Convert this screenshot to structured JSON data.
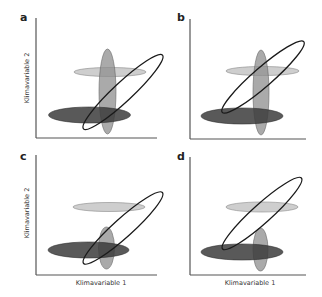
{
  "figure": {
    "colors": {
      "light": "#c6c6c6",
      "mid": "#8e8e8e",
      "dark": "#3c3c3c",
      "outline": "#1a1a1a",
      "axis": "#555555"
    },
    "panels": [
      {
        "label": "a",
        "ylabel": "Klimavariable 2",
        "xlabel": "",
        "light": {
          "cx": 110,
          "cy": 72,
          "rx": 36,
          "ry": 4.5
        },
        "vertical": {
          "cx": 107.5,
          "cy": 91.5,
          "rx": 8.5,
          "ry": 42.5
        },
        "dark": {
          "cx": 89.5,
          "cy": 115,
          "rx": 41,
          "ry": 8
        },
        "outline": {
          "cx": 123,
          "cy": 92,
          "rx": 54,
          "ry": 9.5,
          "angle": -43
        }
      },
      {
        "label": "b",
        "ylabel": "",
        "xlabel": "",
        "light": {
          "cx": 262.5,
          "cy": 71,
          "rx": 36.5,
          "ry": 4.5
        },
        "vertical": {
          "cx": 261,
          "cy": 92.5,
          "rx": 8,
          "ry": 42.5
        },
        "dark": {
          "cx": 242,
          "cy": 116,
          "rx": 41,
          "ry": 8
        },
        "outline": {
          "cx": 263,
          "cy": 77,
          "rx": 54,
          "ry": 9.5,
          "angle": -41
        }
      },
      {
        "label": "c",
        "ylabel": "Klimavariable 2",
        "xlabel": "Klimavariable 1",
        "light": {
          "cx": 109,
          "cy": 207,
          "rx": 36,
          "ry": 4.5
        },
        "vertical": {
          "cx": 106.5,
          "cy": 248,
          "rx": 8,
          "ry": 21
        },
        "dark": {
          "cx": 88.5,
          "cy": 250,
          "rx": 40.5,
          "ry": 8
        },
        "outline": {
          "cx": 123,
          "cy": 228,
          "rx": 53,
          "ry": 9.5,
          "angle": -42
        }
      },
      {
        "label": "d",
        "ylabel": "",
        "xlabel": "Klimavariable 1",
        "light": {
          "cx": 262,
          "cy": 207,
          "rx": 36,
          "ry": 5
        },
        "vertical": {
          "cx": 260.5,
          "cy": 249.5,
          "rx": 7.5,
          "ry": 21.5
        },
        "dark": {
          "cx": 242,
          "cy": 252,
          "rx": 41,
          "ry": 8
        },
        "outline": {
          "cx": 262,
          "cy": 213.5,
          "rx": 53,
          "ry": 9.5,
          "angle": -42
        }
      }
    ]
  }
}
